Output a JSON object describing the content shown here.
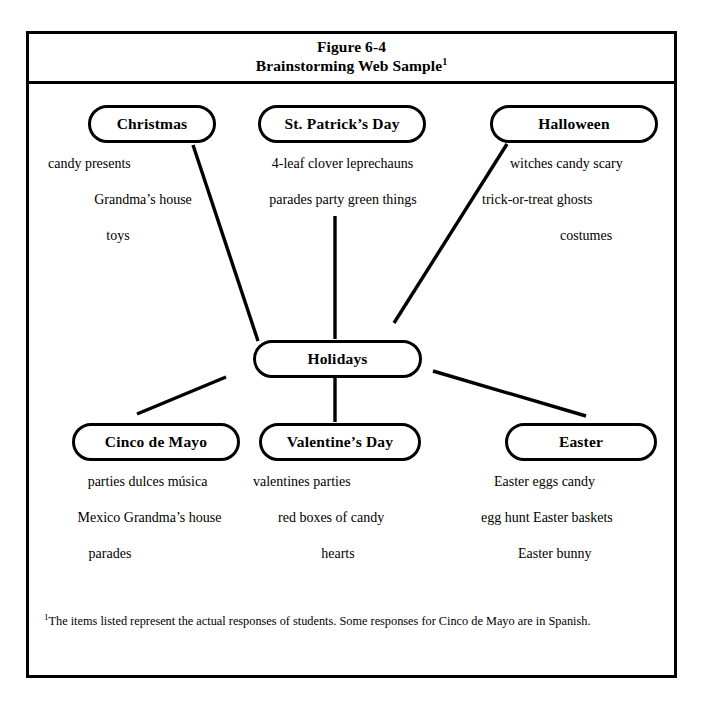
{
  "figure": {
    "title_line1": "Figure 6-4",
    "title_line2": "Brainstorming Web Sample",
    "title_footnote_marker": "1"
  },
  "center_node": {
    "label": "Holidays"
  },
  "branches": [
    {
      "id": "christmas",
      "label": "Christmas",
      "rows": [
        "candy    presents",
        "Grandma’s house",
        "toys"
      ]
    },
    {
      "id": "st-patricks-day",
      "label": "St. Patrick’s Day",
      "rows": [
        "4-leaf clover   leprechauns",
        "parades   party   green things"
      ]
    },
    {
      "id": "halloween",
      "label": "Halloween",
      "rows": [
        "witches   candy   scary",
        "trick-or-treat    ghosts",
        "costumes"
      ]
    },
    {
      "id": "cinco-de-mayo",
      "label": "Cinco de Mayo",
      "rows": [
        "parties   dulces   música",
        "Mexico       Grandma’s house",
        "parades"
      ]
    },
    {
      "id": "valentines-day",
      "label": "Valentine’s Day",
      "rows": [
        "valentines   parties",
        "red   boxes of candy",
        "hearts"
      ]
    },
    {
      "id": "easter",
      "label": "Easter",
      "rows": [
        "Easter eggs       candy",
        "egg hunt  Easter baskets",
        "Easter bunny"
      ]
    }
  ],
  "footnote": {
    "marker": "1",
    "text": "The items listed represent the actual responses of students. Some responses for Cinco de Mayo are in Spanish."
  },
  "colors": {
    "ink": "#000000",
    "paper": "#ffffff"
  }
}
